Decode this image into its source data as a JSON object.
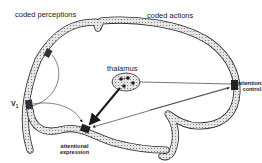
{
  "diagram": {
    "type": "schematic brain attention diagram",
    "labels": {
      "coded_perceptions": "coded perceptions",
      "coded_actions": "coded actions",
      "thalamus": "thalamus",
      "v1_main": "V",
      "v1_sub": "1",
      "attentional_control_line1": "attentional",
      "attentional_control_line2": "control",
      "attentional_expression_line1": "attentional",
      "attentional_expression_line2": "expression"
    },
    "colors": {
      "outline": "#2a2a2a",
      "cortex_fill": "#d9d9d9",
      "dark_patch": "#333333",
      "background": "#ffffff"
    }
  }
}
